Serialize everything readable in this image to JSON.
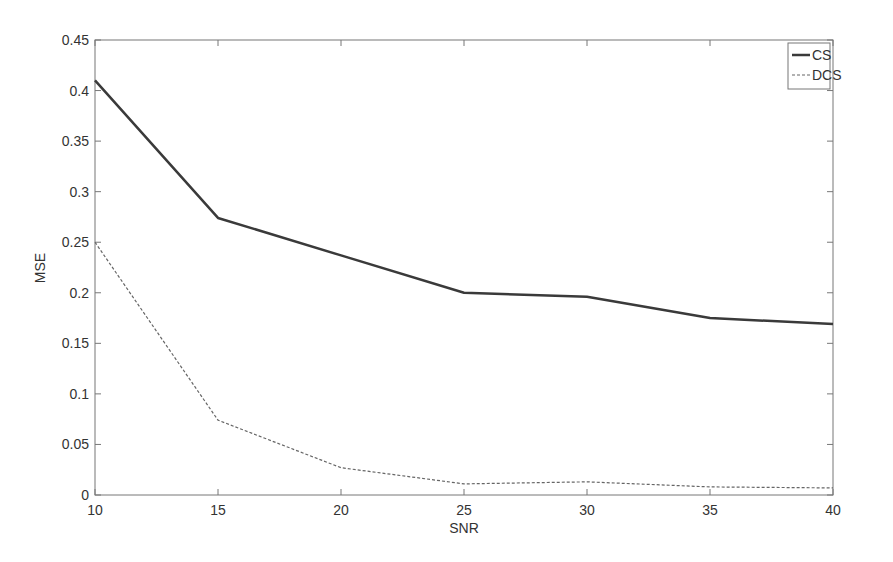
{
  "chart_data": {
    "type": "line",
    "title": "",
    "xlabel": "SNR",
    "ylabel": "MSE",
    "x": [
      10,
      15,
      20,
      25,
      30,
      35,
      40
    ],
    "xlim": [
      10,
      40
    ],
    "ylim": [
      0,
      0.45
    ],
    "xticks": [
      "10",
      "15",
      "20",
      "25",
      "30",
      "35",
      "40"
    ],
    "yticks": [
      "0",
      "0.05",
      "0.1",
      "0.15",
      "0.2",
      "0.25",
      "0.3",
      "0.35",
      "0.4",
      "0.45"
    ],
    "grid": false,
    "legend_position": "upper right",
    "series": [
      {
        "name": "CS",
        "style": "solid",
        "color": "#3a3a3a",
        "values": [
          0.41,
          0.274,
          0.237,
          0.2,
          0.196,
          0.175,
          0.169
        ]
      },
      {
        "name": "DCS",
        "style": "dashed",
        "color": "#666666",
        "values": [
          0.25,
          0.074,
          0.027,
          0.011,
          0.013,
          0.008,
          0.007
        ]
      }
    ]
  }
}
